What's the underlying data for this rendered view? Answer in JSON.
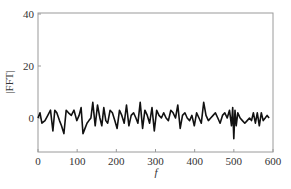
{
  "chart_data": {
    "type": "line",
    "title": "",
    "xlabel": "f",
    "ylabel": "|FFT|",
    "xlim": [
      0,
      600
    ],
    "ylim": [
      -13,
      40
    ],
    "xticks": [
      0,
      100,
      200,
      300,
      400,
      500,
      600
    ],
    "yticks": [
      0,
      20,
      40
    ],
    "grid": false,
    "legend": null,
    "series": [
      {
        "name": "|FFT|",
        "color": "#111111",
        "x": [
          0,
          5,
          10,
          18,
          25,
          32,
          38,
          43,
          48,
          55,
          60,
          66,
          72,
          78,
          85,
          92,
          99,
          105,
          110,
          115,
          120,
          125,
          130,
          135,
          140,
          146,
          152,
          158,
          163,
          168,
          173,
          178,
          184,
          190,
          196,
          202,
          208,
          214,
          220,
          226,
          232,
          238,
          244,
          250,
          255,
          261,
          267,
          273,
          279,
          285,
          291,
          297,
          303,
          309,
          315,
          321,
          327,
          333,
          339,
          345,
          351,
          357,
          363,
          369,
          375,
          381,
          387,
          393,
          399,
          405,
          411,
          417,
          423,
          429,
          435,
          441,
          447,
          453,
          459,
          465,
          471,
          477,
          483,
          489,
          494,
          497,
          500,
          503,
          506,
          510,
          516,
          522,
          528,
          534,
          540,
          545,
          550,
          555,
          560,
          565,
          570,
          575,
          580,
          585,
          590
        ],
        "y": [
          0,
          2,
          -2,
          -1,
          1,
          3,
          -5,
          3,
          2,
          -1,
          -3,
          -6,
          3,
          2,
          1,
          3,
          -1,
          1,
          4,
          -6,
          -4,
          -2,
          -1,
          0,
          6,
          -3,
          5,
          0,
          -3,
          4,
          -1,
          -2,
          3,
          2,
          -1,
          -4,
          3,
          1,
          -2,
          5,
          -3,
          1,
          2,
          0,
          -2,
          6,
          -4,
          3,
          1,
          -2,
          4,
          -5,
          3,
          1,
          0,
          2,
          0,
          -1,
          3,
          2,
          0,
          5,
          -4,
          1,
          2,
          0,
          -1,
          1,
          -3,
          2,
          0,
          -2,
          6,
          1,
          -1,
          0,
          1,
          2,
          0,
          -2,
          1,
          2,
          0,
          3,
          -3,
          4,
          -8,
          3,
          -3,
          2,
          0,
          -1,
          -2,
          -1,
          0,
          -1,
          2,
          -2,
          2,
          -3,
          2,
          -1,
          0,
          1,
          0
        ]
      }
    ]
  }
}
